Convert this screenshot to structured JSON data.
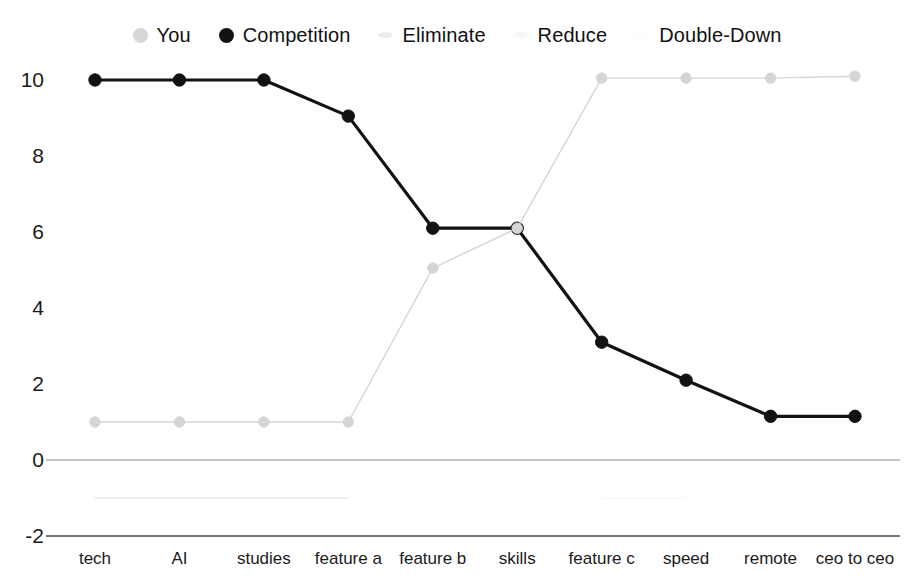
{
  "legend": {
    "items": [
      {
        "label": "You",
        "marker": "filled-circle-light-gray",
        "color": "#d7d7d7"
      },
      {
        "label": "Competition",
        "marker": "filled-circle-black",
        "color": "#121212"
      },
      {
        "label": "Eliminate",
        "marker": "short-bar-faint-gray",
        "color": "#ececec"
      },
      {
        "label": "Reduce",
        "marker": "short-bar-very-faint",
        "color": "#f7f7f7"
      },
      {
        "label": "Double-Down",
        "marker": "short-bar-near-white",
        "color": "#fdfdfd"
      }
    ]
  },
  "chart_data": {
    "type": "line",
    "title": "",
    "xlabel": "",
    "ylabel": "",
    "grid": false,
    "legend_position": "top",
    "ylim": [
      -2,
      11
    ],
    "yticks": [
      10,
      8,
      6,
      4,
      2,
      0,
      -2
    ],
    "ytick_labels": [
      "10",
      "8",
      "6",
      "4",
      "2",
      "0",
      "-2"
    ],
    "categories": [
      "tech",
      "AI",
      "studies",
      "feature a",
      "feature b",
      "skills",
      "feature c",
      "speed",
      "remote",
      "ceo to ceo"
    ],
    "series": [
      {
        "name": "Competition",
        "color": "#121212",
        "marker": "circle",
        "values": [
          10,
          10,
          10,
          9.05,
          6.1,
          6.1,
          3.1,
          2.1,
          1.15,
          1.15
        ]
      },
      {
        "name": "You",
        "color": "#d5d5d5",
        "marker": "circle",
        "values": [
          1,
          1,
          1,
          1,
          5.05,
          6.1,
          10.05,
          10.05,
          10.05,
          10.1
        ]
      },
      {
        "name": "Eliminate",
        "color": "#efefef",
        "marker": "none",
        "values": [
          -1,
          -1,
          -1,
          -1,
          null,
          null,
          null,
          null,
          null,
          null
        ]
      },
      {
        "name": "Reduce",
        "color": "#fafafa",
        "marker": "none",
        "values": [
          null,
          null,
          null,
          null,
          null,
          null,
          -1,
          -1,
          null,
          null
        ]
      }
    ],
    "axis_lines": {
      "zero_line": 0,
      "bottom_line": -2
    }
  }
}
